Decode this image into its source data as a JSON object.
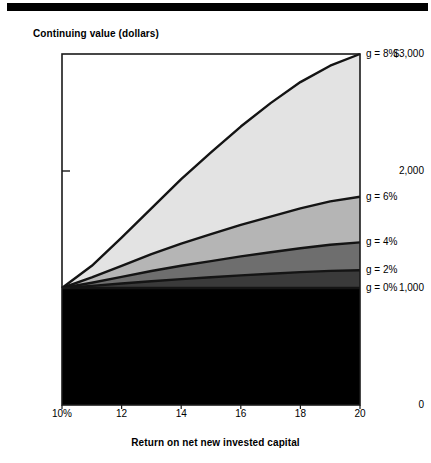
{
  "chart_data": {
    "type": "area",
    "title": "",
    "ylabel": "Continuing value (dollars)",
    "xlabel": "Return on net new invested capital",
    "xlim": [
      10,
      20
    ],
    "ylim": [
      0,
      3000
    ],
    "grid": false,
    "legend_position": "right-inline",
    "x_tick_labels": [
      "10%",
      "12",
      "14",
      "16",
      "18",
      "20"
    ],
    "x_tick_values": [
      10,
      12,
      14,
      16,
      18,
      20
    ],
    "y_tick_labels": [
      "$3,000",
      "2,000",
      "1,000",
      "0"
    ],
    "y_tick_values": [
      3000,
      2000,
      1000,
      0
    ],
    "x": [
      10,
      11,
      12,
      13,
      14,
      15,
      16,
      17,
      18,
      19,
      20
    ],
    "series": [
      {
        "name": "g = 8%",
        "label": "g = 8%",
        "color": "#e3e3e3",
        "values": [
          1000,
          1190,
          1430,
          1680,
          1930,
          2160,
          2380,
          2580,
          2760,
          2900,
          3000
        ]
      },
      {
        "name": "g = 6%",
        "label": "g = 6%",
        "color": "#b5b5b5",
        "values": [
          1000,
          1090,
          1190,
          1290,
          1380,
          1460,
          1540,
          1610,
          1680,
          1740,
          1780
        ]
      },
      {
        "name": "g = 4%",
        "label": "g = 4%",
        "color": "#6e6e6e",
        "values": [
          1000,
          1045,
          1095,
          1145,
          1190,
          1230,
          1270,
          1305,
          1340,
          1370,
          1390
        ]
      },
      {
        "name": "g = 2%",
        "label": "g = 2%",
        "color": "#3a3a3a",
        "values": [
          1000,
          1018,
          1038,
          1058,
          1076,
          1092,
          1108,
          1122,
          1136,
          1146,
          1152
        ]
      },
      {
        "name": "g = 0%",
        "label": "g = 0%",
        "color": "#000000",
        "values": [
          1000,
          1000,
          1000,
          1000,
          1000,
          1000,
          1000,
          1000,
          1000,
          1000,
          1000
        ]
      }
    ]
  },
  "axes": {
    "y_title": "Continuing value (dollars)",
    "x_title": "Return on net new invested capital",
    "y_ticks": [
      {
        "label": "$3,000",
        "value": 3000
      },
      {
        "label": "2,000",
        "value": 2000
      },
      {
        "label": "1,000",
        "value": 1000
      },
      {
        "label": "0",
        "value": 0
      }
    ],
    "x_ticks": [
      {
        "label": "10%",
        "value": 10
      },
      {
        "label": "12",
        "value": 12
      },
      {
        "label": "14",
        "value": 14
      },
      {
        "label": "16",
        "value": 16
      },
      {
        "label": "18",
        "value": 18
      },
      {
        "label": "20",
        "value": 20
      }
    ]
  },
  "legend": [
    {
      "label": "g = 8%"
    },
    {
      "label": "g = 6%"
    },
    {
      "label": "g = 4%"
    },
    {
      "label": "g = 2%"
    },
    {
      "label": "g = 0%"
    }
  ]
}
